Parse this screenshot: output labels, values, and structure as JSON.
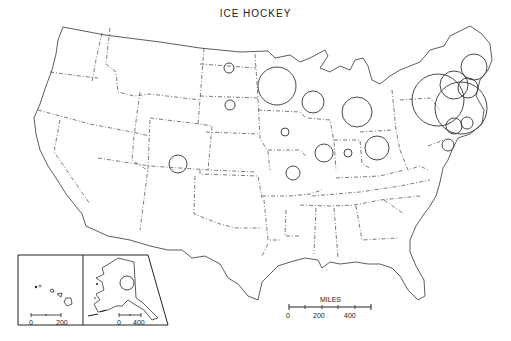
{
  "map": {
    "title": "ICE HOCKEY",
    "scale_main": {
      "label": "MILES",
      "ticks": [
        "0",
        "200",
        "400"
      ]
    },
    "scale_hawaii": {
      "ticks": [
        "0",
        "200"
      ]
    },
    "scale_alaska": {
      "ticks": [
        "0",
        "400"
      ]
    },
    "circles": [
      {
        "region": "North Dakota",
        "cx": 229,
        "cy": 68,
        "r": 5
      },
      {
        "region": "South Dakota",
        "cx": 230,
        "cy": 105,
        "r": 5
      },
      {
        "region": "Minnesota",
        "cx": 277,
        "cy": 86,
        "r": 19
      },
      {
        "region": "Wisconsin",
        "cx": 313,
        "cy": 102,
        "r": 11
      },
      {
        "region": "Michigan",
        "cx": 357,
        "cy": 112,
        "r": 15
      },
      {
        "region": "Iowa",
        "cx": 285,
        "cy": 132,
        "r": 4
      },
      {
        "region": "Illinois",
        "cx": 324,
        "cy": 153,
        "r": 9
      },
      {
        "region": "Indiana",
        "cx": 348,
        "cy": 153,
        "r": 4
      },
      {
        "region": "Ohio",
        "cx": 377,
        "cy": 148,
        "r": 12
      },
      {
        "region": "Missouri",
        "cx": 293,
        "cy": 173,
        "r": 7
      },
      {
        "region": "Colorado",
        "cx": 178,
        "cy": 164,
        "r": 9
      },
      {
        "region": "Maine",
        "cx": 474,
        "cy": 67,
        "r": 13
      },
      {
        "region": "New York",
        "cx": 438,
        "cy": 100,
        "r": 26
      },
      {
        "region": "Massachusetts",
        "cx": 461,
        "cy": 108,
        "r": 26
      },
      {
        "region": "Vermont",
        "cx": 454,
        "cy": 85,
        "r": 14
      },
      {
        "region": "New Hampshire",
        "cx": 468,
        "cy": 88,
        "r": 10
      },
      {
        "region": "Connecticut",
        "cx": 454,
        "cy": 126,
        "r": 8
      },
      {
        "region": "Rhode Island",
        "cx": 467,
        "cy": 123,
        "r": 6
      },
      {
        "region": "New Jersey",
        "cx": 448,
        "cy": 145,
        "r": 6
      },
      {
        "region": "Alaska",
        "cx": 127,
        "cy": 283,
        "r": 7
      }
    ]
  }
}
